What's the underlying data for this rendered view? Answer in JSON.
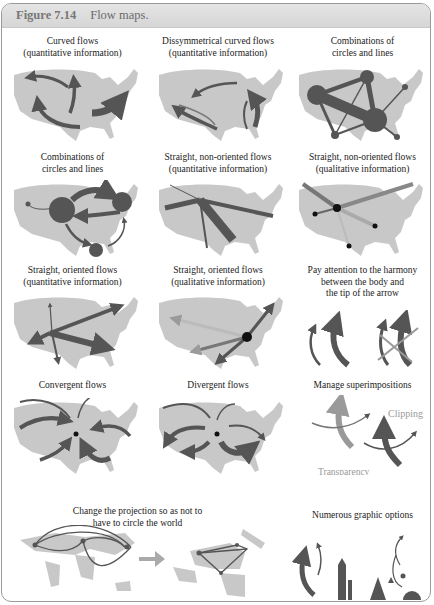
{
  "header": {
    "figure_number": "Figure 7.14",
    "title": "Flow maps."
  },
  "panels": [
    {
      "id": "curved",
      "lines": [
        "Curved flows",
        "(quantitative information)"
      ]
    },
    {
      "id": "dissym",
      "lines": [
        "Dissymmetrical curved flows",
        "(quantitative information)"
      ]
    },
    {
      "id": "comb1",
      "lines": [
        "Combinations of",
        "circles and lines"
      ]
    },
    {
      "id": "comb2",
      "lines": [
        "Combinations of",
        "circles and lines"
      ]
    },
    {
      "id": "straight-nonor-quant",
      "lines": [
        "Straight, non-oriented flows",
        "(quantitative information)"
      ]
    },
    {
      "id": "straight-nonor-qual",
      "lines": [
        "Straight, non-oriented flows",
        "(qualitative information)"
      ]
    },
    {
      "id": "straight-or-quant",
      "lines": [
        "Straight, oriented flows",
        "(quantitative information)"
      ]
    },
    {
      "id": "straight-or-qual",
      "lines": [
        "Straight, oriented flows",
        "(qualitative information)"
      ]
    },
    {
      "id": "harmony",
      "lines": [
        "Pay attention to the harmony",
        "between the body and",
        "the tip of the arrow"
      ]
    },
    {
      "id": "convergent",
      "lines": [
        "Convergent flows"
      ]
    },
    {
      "id": "divergent",
      "lines": [
        "Divergent flows"
      ]
    },
    {
      "id": "superimp",
      "lines": [
        "Manage superimpositions"
      ],
      "labels": {
        "clipping": "Clipping",
        "transparency": "Transparency"
      }
    },
    {
      "id": "projection",
      "lines": [
        "Change the projection so as not to",
        "have to circle the world"
      ]
    },
    {
      "id": "options",
      "lines": [
        "Numerous graphic options"
      ]
    }
  ],
  "colors": {
    "map": "#c8c8c8",
    "flow": "#555555",
    "flow_light": "#9a9a9a",
    "header_bg": "#dcdcdc"
  }
}
